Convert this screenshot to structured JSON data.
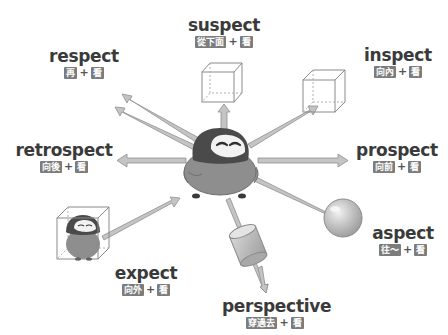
{
  "diagram": {
    "center": "penguin",
    "colors": {
      "text": "#3a3a3a",
      "gloss_box": "#7c7c7c",
      "highlight": "#d7d7d7",
      "arrow": "#b5b5b5",
      "penguin_head": "#4a4a4a",
      "penguin_body": "#8e8e8e",
      "penguin_face": "#f2f2f2"
    },
    "words": [
      {
        "id": "respect",
        "term": "respect",
        "prefix": "再",
        "plus": "+",
        "root": "看",
        "object": "none"
      },
      {
        "id": "suspect",
        "term": "suspect",
        "prefix": "從下面",
        "plus": "+",
        "root": "看",
        "object": "cube"
      },
      {
        "id": "inspect",
        "term": "inspect",
        "prefix": "向內",
        "plus": "+",
        "root": "看",
        "object": "cube"
      },
      {
        "id": "retrospect",
        "term": "retrospect",
        "prefix": "向後",
        "plus": "+",
        "root": "看",
        "object": "none"
      },
      {
        "id": "prospect",
        "term": "prospect",
        "prefix": "向前",
        "plus": "+",
        "root": "看",
        "object": "none"
      },
      {
        "id": "aspect",
        "term": "aspect",
        "prefix": "往～",
        "plus": "+",
        "root": "看",
        "object": "sphere"
      },
      {
        "id": "expect",
        "term": "expect",
        "prefix": "向外",
        "plus": "+",
        "root": "看",
        "object": "cube-with-penguin"
      },
      {
        "id": "perspective",
        "term": "perspective",
        "prefix": "穿過去",
        "plus": "+",
        "root": "看",
        "object": "cylinder"
      }
    ]
  }
}
